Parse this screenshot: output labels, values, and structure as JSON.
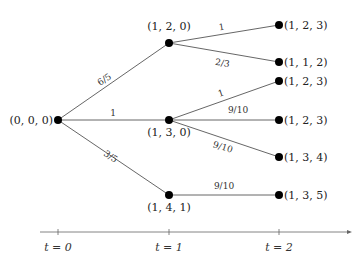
{
  "diagram": {
    "type": "tree",
    "nodes": {
      "root": {
        "label": "(0, 0, 0)"
      },
      "n1a": {
        "label": "(1, 2, 0)"
      },
      "n1b": {
        "label": "(1, 3, 0)"
      },
      "n1c": {
        "label": "(1, 4, 1)"
      },
      "l1": {
        "label": "(1, 2, 3)"
      },
      "l2": {
        "label": "(1, 1, 2)"
      },
      "l3": {
        "label": "(1, 2, 3)"
      },
      "l4": {
        "label": "(1, 2, 3)"
      },
      "l5": {
        "label": "(1, 3, 4)"
      },
      "l6": {
        "label": "(1, 3, 5)"
      }
    },
    "edges": {
      "root_n1a": {
        "label": "6/5"
      },
      "root_n1b": {
        "label": "1"
      },
      "root_n1c": {
        "label": "3/5"
      },
      "n1a_l1": {
        "label": "1"
      },
      "n1a_l2": {
        "label": "2/3"
      },
      "n1b_l3": {
        "label": "1"
      },
      "n1b_l4": {
        "label": "9/10"
      },
      "n1b_l5": {
        "label": "9/10"
      },
      "n1c_l6": {
        "label": "9/10"
      }
    },
    "timeline": {
      "ticks": [
        "t = 0",
        "t = 1",
        "t = 2"
      ]
    }
  }
}
